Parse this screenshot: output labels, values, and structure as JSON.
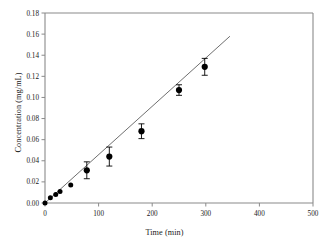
{
  "chart_data": {
    "type": "scatter",
    "title": "",
    "xlabel": "Time (min)",
    "ylabel": "Concentration (mg/mL)",
    "xlim": [
      0,
      500
    ],
    "ylim": [
      0.0,
      0.18
    ],
    "xticks": [
      0,
      100,
      200,
      300,
      400,
      500
    ],
    "xtick_labels": [
      "0",
      "100",
      "200",
      "300",
      "400",
      "500"
    ],
    "yticks": [
      0.0,
      0.02,
      0.04,
      0.06,
      0.08,
      0.1,
      0.12,
      0.14,
      0.16,
      0.18
    ],
    "ytick_labels": [
      "0.00",
      "0.02",
      "0.04",
      "0.06",
      "0.08",
      "0.10",
      "0.12",
      "0.14",
      "0.16",
      "0.18"
    ],
    "grid": false,
    "legend": null,
    "marker": "filled-circle",
    "marker_color": "#000000",
    "line_color": "#6f6f6f",
    "series": [
      {
        "name": "Concentration vs Time",
        "x": [
          0,
          10,
          20,
          28,
          48,
          78,
          120,
          180,
          250,
          298
        ],
        "y": [
          0.0,
          0.005,
          0.008,
          0.011,
          0.017,
          0.031,
          0.044,
          0.068,
          0.107,
          0.129
        ],
        "yerr": [
          0.0,
          0.0,
          0.0,
          0.0,
          0.0,
          0.008,
          0.009,
          0.007,
          0.005,
          0.008
        ]
      }
    ],
    "fit_line": {
      "name": "linear regression",
      "x": [
        0,
        345
      ],
      "y": [
        0.0,
        0.158
      ]
    }
  },
  "axes": {
    "x_axis_name": "time-axis",
    "y_axis_name": "concentration-axis"
  }
}
